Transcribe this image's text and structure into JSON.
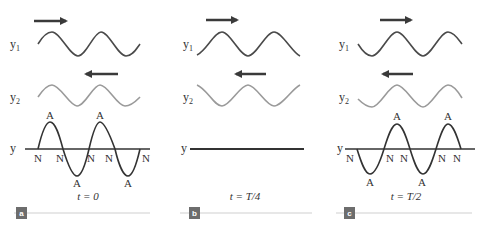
{
  "colors": {
    "wave1": "#4a4a4a",
    "wave2": "#9a9a9a",
    "resultant": "#333333",
    "axis": "#333333",
    "arrow": "#3a3a3a",
    "badge": "#6d6d6d",
    "rule": "#cfcfcf"
  },
  "panels": [
    {
      "badge": "a",
      "caption": "t = 0",
      "y1_label": "y",
      "y1_sub": "1",
      "y2_label": "y",
      "y2_sub": "2",
      "resultant_label": "y",
      "y1_direction": "right",
      "y2_direction": "left",
      "resultant_state": "maximum displacement",
      "node_labels": [
        "N",
        "N",
        "N",
        "N",
        "N"
      ],
      "antinode_labels": [
        "A",
        "A",
        "A",
        "A"
      ]
    },
    {
      "badge": "b",
      "caption": "t = T/4",
      "y1_label": "y",
      "y1_sub": "1",
      "y2_label": "y",
      "y2_sub": "2",
      "resultant_label": "y",
      "y1_direction": "right",
      "y2_direction": "left",
      "resultant_state": "flat (zero displacement)"
    },
    {
      "badge": "c",
      "caption": "t = T/2",
      "y1_label": "y",
      "y1_sub": "1",
      "y2_label": "y",
      "y2_sub": "2",
      "resultant_label": "y",
      "y1_direction": "right",
      "y2_direction": "left",
      "resultant_state": "inverted maximum displacement",
      "node_labels": [
        "N",
        "N",
        "N",
        "N",
        "N"
      ],
      "antinode_labels": [
        "A",
        "A",
        "A",
        "A"
      ]
    }
  ]
}
